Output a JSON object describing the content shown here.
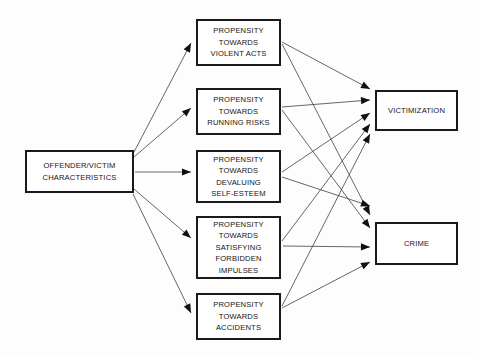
{
  "diagram": {
    "type": "flow-diagram",
    "title_visible": false,
    "background_color": "#fdfdfd",
    "line_color": "#555555",
    "box_border_color": "#1a1a1a",
    "text_color": "#141414",
    "source": {
      "id": "offender-victim-characteristics",
      "lines": [
        "OFFENDER/VICTIM",
        "CHARACTERISTICS"
      ],
      "x": 25,
      "y": 150,
      "w": 109,
      "h": 43
    },
    "mediators": [
      {
        "id": "propensity-violent-acts",
        "lines": [
          "PROPENSITY",
          "TOWARDS",
          "VIOLENT ACTS"
        ],
        "x": 196,
        "y": 19,
        "w": 85,
        "h": 47
      },
      {
        "id": "propensity-running-risks",
        "lines": [
          "PROPENSITY",
          "TOWARDS",
          "RUNNING RISKS"
        ],
        "x": 196,
        "y": 88,
        "w": 85,
        "h": 47
      },
      {
        "id": "propensity-devaluing-self-esteem",
        "lines": [
          "PROPENSITY",
          "TOWARDS",
          "DEVALUING",
          "SELF-ESTEEM"
        ],
        "x": 196,
        "y": 150,
        "w": 85,
        "h": 53
      },
      {
        "id": "propensity-satisfying-forbidden-impulses",
        "lines": [
          "PROPENSITY",
          "TOWARDS",
          "SATISFYING",
          "FORBIDDEN",
          "IMPULSES"
        ],
        "x": 196,
        "y": 216,
        "w": 85,
        "h": 63
      },
      {
        "id": "propensity-accidents",
        "lines": [
          "PROPENSITY",
          "TOWARDS",
          "ACCIDENTS"
        ],
        "x": 196,
        "y": 293,
        "w": 85,
        "h": 47
      }
    ],
    "outcomes": [
      {
        "id": "victimization",
        "lines": [
          "VICTIMIZATION"
        ],
        "x": 375,
        "y": 90,
        "w": 83,
        "h": 41
      },
      {
        "id": "crime",
        "lines": [
          "CRIME"
        ],
        "x": 375,
        "y": 222,
        "w": 83,
        "h": 43
      }
    ],
    "edges": [
      {
        "id": "src-to-violent-acts",
        "from": "offender-victim-characteristics",
        "to": "propensity-violent-acts",
        "x1": 134,
        "y1": 152,
        "x2": 191,
        "y2": 43
      },
      {
        "id": "src-to-running-risks",
        "from": "offender-victim-characteristics",
        "to": "propensity-running-risks",
        "x1": 134,
        "y1": 157,
        "x2": 191,
        "y2": 108
      },
      {
        "id": "src-to-devaluing",
        "from": "offender-victim-characteristics",
        "to": "propensity-devaluing-self-esteem",
        "x1": 135,
        "y1": 172,
        "x2": 191,
        "y2": 172
      },
      {
        "id": "src-to-forbidden-impulses",
        "from": "offender-victim-characteristics",
        "to": "propensity-satisfying-forbidden-impulses",
        "x1": 134,
        "y1": 189,
        "x2": 191,
        "y2": 238
      },
      {
        "id": "src-to-accidents",
        "from": "offender-victim-characteristics",
        "to": "propensity-accidents",
        "x1": 133,
        "y1": 194,
        "x2": 191,
        "y2": 313
      },
      {
        "id": "violent-acts-to-victimization",
        "from": "propensity-violent-acts",
        "to": "victimization",
        "x1": 282,
        "y1": 42,
        "x2": 370,
        "y2": 89
      },
      {
        "id": "violent-acts-to-crime",
        "from": "propensity-violent-acts",
        "to": "crime",
        "x1": 282,
        "y1": 44,
        "x2": 370,
        "y2": 215
      },
      {
        "id": "running-risks-to-victimization",
        "from": "propensity-running-risks",
        "to": "victimization",
        "x1": 282,
        "y1": 107,
        "x2": 370,
        "y2": 100
      },
      {
        "id": "running-risks-to-crime",
        "from": "propensity-running-risks",
        "to": "crime",
        "x1": 282,
        "y1": 110,
        "x2": 370,
        "y2": 228
      },
      {
        "id": "devaluing-to-victimization",
        "from": "propensity-devaluing-self-esteem",
        "to": "victimization",
        "x1": 282,
        "y1": 172,
        "x2": 370,
        "y2": 113
      },
      {
        "id": "devaluing-to-crime",
        "from": "propensity-devaluing-self-esteem",
        "to": "crime",
        "x1": 282,
        "y1": 177,
        "x2": 370,
        "y2": 206
      },
      {
        "id": "impulses-to-victimization",
        "from": "propensity-satisfying-forbidden-impulses",
        "to": "victimization",
        "x1": 282,
        "y1": 241,
        "x2": 370,
        "y2": 124
      },
      {
        "id": "impulses-to-crime",
        "from": "propensity-satisfying-forbidden-impulses",
        "to": "crime",
        "x1": 283,
        "y1": 246,
        "x2": 370,
        "y2": 247
      },
      {
        "id": "accidents-to-victimization",
        "from": "propensity-accidents",
        "to": "victimization",
        "x1": 282,
        "y1": 306,
        "x2": 370,
        "y2": 134
      },
      {
        "id": "accidents-to-crime",
        "from": "propensity-accidents",
        "to": "crime",
        "x1": 282,
        "y1": 308,
        "x2": 370,
        "y2": 262
      }
    ]
  }
}
